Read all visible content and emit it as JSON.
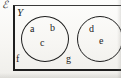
{
  "figure": {
    "type": "euler-venn-diagram",
    "universal_set_symbol": "ℰ",
    "set_label": "Y",
    "rectangle": {
      "role": "universal-set-boundary",
      "border_color": "#1e1e1e"
    },
    "background_color": "#fbfaf8",
    "ink_color": "#232323"
  },
  "circles": [
    {
      "id": "left",
      "name": "set-circle-left",
      "elements": [
        "a",
        "b",
        "c"
      ]
    },
    {
      "id": "right",
      "name": "set-circle-right",
      "elements": [
        "d",
        "e"
      ]
    }
  ],
  "elements": {
    "a": "a",
    "b": "b",
    "c": "c",
    "d": "d",
    "e": "e",
    "f": "f",
    "g": "g"
  },
  "outside_elements": [
    "f",
    "g"
  ]
}
